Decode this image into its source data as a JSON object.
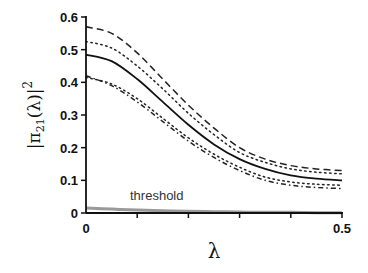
{
  "chart_data": {
    "type": "line",
    "title": "",
    "xlabel": "λ",
    "ylabel": "|π21(λ)|²",
    "xlim": [
      0,
      0.5
    ],
    "ylim": [
      0,
      0.6
    ],
    "x_ticks": [
      0,
      0.1,
      0.2,
      0.3,
      0.4,
      0.5
    ],
    "x_tick_labels": [
      "0",
      "",
      "",
      "",
      "",
      "0.5"
    ],
    "y_ticks": [
      0,
      0.1,
      0.2,
      0.3,
      0.4,
      0.5,
      0.6
    ],
    "y_tick_labels": [
      "0",
      "0.1",
      "0.2",
      "0.3",
      "0.4",
      "0.5",
      "0.6"
    ],
    "grid": false,
    "legend": null,
    "annotations": [
      {
        "text": "threshold",
        "x": 0.11,
        "y": 0.03
      }
    ],
    "x": [
      0,
      0.05,
      0.1,
      0.15,
      0.2,
      0.25,
      0.3,
      0.35,
      0.4,
      0.45,
      0.5
    ],
    "series": [
      {
        "name": "upper dashed",
        "style": "dashed",
        "color": "#222222",
        "values": [
          0.57,
          0.55,
          0.49,
          0.41,
          0.33,
          0.26,
          0.2,
          0.165,
          0.145,
          0.135,
          0.13
        ]
      },
      {
        "name": "upper dotted",
        "style": "dotted",
        "color": "#222222",
        "values": [
          0.525,
          0.505,
          0.45,
          0.38,
          0.305,
          0.24,
          0.185,
          0.155,
          0.135,
          0.125,
          0.12
        ]
      },
      {
        "name": "mean",
        "style": "solid",
        "color": "#111111",
        "values": [
          0.485,
          0.465,
          0.41,
          0.34,
          0.27,
          0.21,
          0.165,
          0.135,
          0.115,
          0.105,
          0.1
        ]
      },
      {
        "name": "lower dotted",
        "style": "dotted",
        "color": "#222222",
        "values": [
          0.415,
          0.395,
          0.35,
          0.29,
          0.23,
          0.18,
          0.14,
          0.11,
          0.095,
          0.088,
          0.085
        ]
      },
      {
        "name": "lower dash-dot",
        "style": "dashdot",
        "color": "#222222",
        "values": [
          0.42,
          0.39,
          0.34,
          0.28,
          0.22,
          0.17,
          0.13,
          0.1,
          0.085,
          0.078,
          0.075
        ]
      },
      {
        "name": "threshold",
        "style": "solid",
        "color": "#999999",
        "values": [
          0.015,
          0.012,
          0.009,
          0.007,
          0.005,
          0.004,
          0.003,
          0.002,
          0.002,
          0.001,
          0.001
        ]
      }
    ]
  }
}
